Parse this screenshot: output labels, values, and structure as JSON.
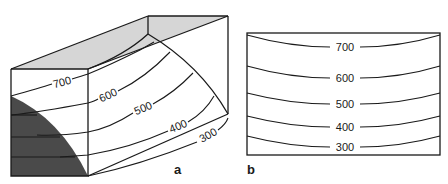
{
  "figure": {
    "panels": [
      {
        "id": "a",
        "label": "a",
        "description": "3D block diagram with curved contour surfaces and shaded body",
        "contours": [
          {
            "value": "700"
          },
          {
            "value": "600"
          },
          {
            "value": "500"
          },
          {
            "value": "400"
          },
          {
            "value": "300"
          }
        ]
      },
      {
        "id": "b",
        "label": "b",
        "description": "2D cross-section with concave-up contour lines",
        "contours": [
          {
            "value": "700"
          },
          {
            "value": "600"
          },
          {
            "value": "500"
          },
          {
            "value": "400"
          },
          {
            "value": "300"
          }
        ]
      }
    ],
    "colors": {
      "line": "#1a1a1a",
      "top_face": "#d6d6d6",
      "dark_body": "#4a4a4a",
      "background": "#ffffff"
    }
  }
}
